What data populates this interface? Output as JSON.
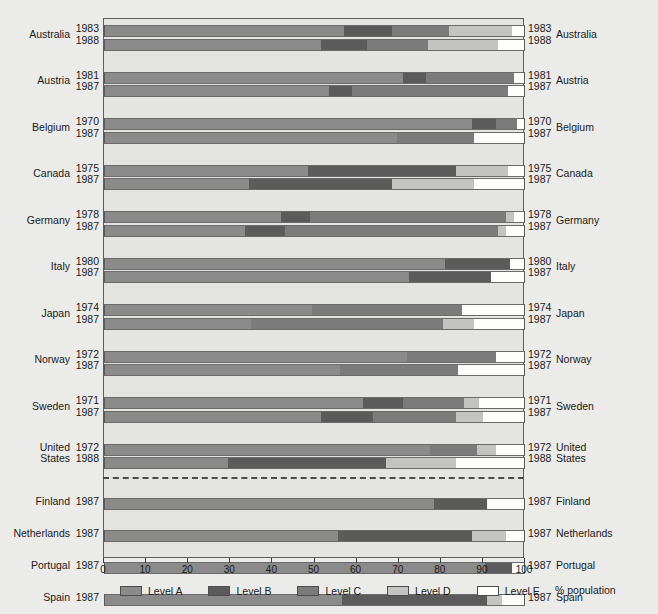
{
  "chart_data": {
    "type": "bar",
    "subtype": "stacked-horizontal-100",
    "title": "",
    "xlabel": "% population",
    "ylabel": "",
    "xlim": [
      0,
      100
    ],
    "xticks": [
      0,
      10,
      20,
      30,
      40,
      50,
      60,
      70,
      80,
      90,
      100
    ],
    "grid": false,
    "legend_position": "bottom",
    "series": [
      {
        "name": "Level A",
        "color": "#8a8a8a"
      },
      {
        "name": "Level B",
        "color": "#5b5b5b"
      },
      {
        "name": "Level C",
        "color": "#7b7b7b"
      },
      {
        "name": "Level D",
        "color": "#c3c3c1"
      },
      {
        "name": "Level E",
        "color": "#fdfdfb"
      }
    ],
    "groups": [
      {
        "country": "Australia",
        "rows": [
          {
            "year": "1983",
            "values": [
              57.0,
              11.5,
              13.5,
              15.0,
              3.0
            ]
          },
          {
            "year": "1988",
            "values": [
              51.5,
              11.0,
              14.5,
              16.5,
              6.5
            ]
          }
        ]
      },
      {
        "country": "Austria",
        "rows": [
          {
            "year": "1981",
            "values": [
              71.0,
              5.5,
              21.0,
              0.0,
              2.5
            ]
          },
          {
            "year": "1987",
            "values": [
              53.5,
              5.5,
              37.0,
              0.0,
              4.0
            ]
          }
        ]
      },
      {
        "country": "Belgium",
        "rows": [
          {
            "year": "1970",
            "values": [
              87.5,
              5.5,
              5.0,
              0.0,
              2.0
            ]
          },
          {
            "year": "1987",
            "values": [
              69.5,
              0.0,
              18.5,
              0.0,
              12.0
            ]
          }
        ]
      },
      {
        "country": "Canada",
        "rows": [
          {
            "year": "1975",
            "values": [
              48.5,
              35.0,
              0.0,
              12.5,
              4.0
            ]
          },
          {
            "year": "1987",
            "values": [
              34.5,
              34.0,
              0.0,
              19.5,
              12.0
            ]
          }
        ]
      },
      {
        "country": "Germany",
        "rows": [
          {
            "year": "1978",
            "values": [
              42.0,
              7.0,
              46.5,
              2.0,
              2.5
            ]
          },
          {
            "year": "1987",
            "values": [
              33.5,
              9.5,
              50.5,
              2.0,
              4.5
            ]
          }
        ]
      },
      {
        "country": "Italy",
        "rows": [
          {
            "year": "1980",
            "values": [
              81.0,
              15.5,
              0.0,
              0.0,
              3.5
            ]
          },
          {
            "year": "1987",
            "values": [
              72.5,
              19.5,
              0.0,
              0.0,
              8.0
            ]
          }
        ]
      },
      {
        "country": "Japan",
        "rows": [
          {
            "year": "1974",
            "values": [
              49.5,
              0.0,
              35.5,
              0.0,
              15.0
            ]
          },
          {
            "year": "1987",
            "values": [
              35.0,
              0.0,
              45.5,
              7.5,
              12.0
            ]
          }
        ]
      },
      {
        "country": "Norway",
        "rows": [
          {
            "year": "1972",
            "values": [
              72.0,
              0.0,
              21.0,
              0.0,
              7.0
            ]
          },
          {
            "year": "1987",
            "values": [
              56.0,
              0.0,
              28.0,
              0.0,
              16.0
            ]
          }
        ]
      },
      {
        "country": "Sweden",
        "rows": [
          {
            "year": "1971",
            "values": [
              61.5,
              9.5,
              14.5,
              3.5,
              11.0
            ]
          },
          {
            "year": "1987",
            "values": [
              51.5,
              12.5,
              19.5,
              6.5,
              10.0
            ]
          }
        ]
      },
      {
        "country": "United States",
        "country_lines": [
          "United",
          "States"
        ],
        "rows": [
          {
            "year": "1972",
            "values": [
              77.5,
              0.0,
              11.0,
              4.5,
              7.0
            ]
          },
          {
            "year": "1988",
            "values": [
              29.5,
              37.5,
              0.0,
              16.5,
              16.5
            ]
          }
        ]
      }
    ],
    "groups_below": [
      {
        "country": "Finland",
        "rows": [
          {
            "year": "1987",
            "values": [
              78.5,
              12.5,
              0.0,
              0.0,
              9.0
            ]
          }
        ]
      },
      {
        "country": "Netherlands",
        "rows": [
          {
            "year": "1987",
            "values": [
              55.5,
              32.0,
              0.0,
              8.0,
              4.5
            ]
          }
        ]
      },
      {
        "country": "Portugal",
        "rows": [
          {
            "year": "1987",
            "values": [
              90.5,
              6.5,
              0.0,
              0.0,
              3.0
            ]
          }
        ]
      },
      {
        "country": "Spain",
        "rows": [
          {
            "year": "1987",
            "values": [
              56.5,
              34.5,
              0.0,
              3.5,
              5.5
            ]
          }
        ]
      },
      {
        "country": "Switzerland",
        "rows": [
          {
            "year": "1986",
            "values": [
              30.5,
              54.0,
              0.0,
              2.5,
              13.0
            ]
          }
        ]
      },
      {
        "country": "United Kingdom",
        "country_lines": [
          "United",
          "Kingdom"
        ],
        "rows": [
          {
            "year": "1987",
            "values": [
              63.0,
              6.5,
              17.0,
              0.0,
              13.5
            ]
          }
        ]
      }
    ]
  },
  "legend": {
    "items": [
      {
        "label": "Level A"
      },
      {
        "label": "Level B"
      },
      {
        "label": "Level C"
      },
      {
        "label": "Level D"
      },
      {
        "label": "Level E"
      }
    ],
    "axis_title": "% population"
  },
  "axis": {
    "ticks": [
      "0",
      "10",
      "20",
      "30",
      "40",
      "50",
      "60",
      "70",
      "80",
      "90",
      "100"
    ]
  }
}
